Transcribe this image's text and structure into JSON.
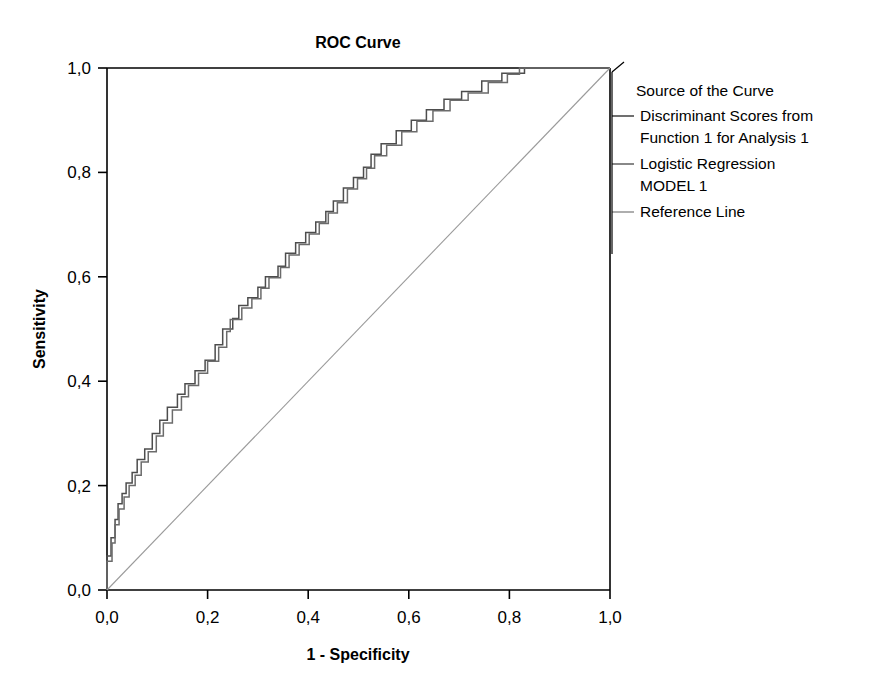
{
  "chart_data": {
    "type": "line",
    "title": "ROC Curve",
    "xlabel": "1 - Specificity",
    "ylabel": "Sensitivity",
    "xlim": [
      0,
      1
    ],
    "ylim": [
      0,
      1
    ],
    "grid": false,
    "legend_position": "right",
    "legend_title": "Source of the Curve",
    "x_ticks": [
      "0,0",
      "0,2",
      "0,4",
      "0,6",
      "0,8",
      "1,0"
    ],
    "y_ticks": [
      "0,0",
      "0,2",
      "0,4",
      "0,6",
      "0,8",
      "1,0"
    ],
    "x_tick_values": [
      0,
      0.2,
      0.4,
      0.6,
      0.8,
      1.0
    ],
    "y_tick_values": [
      0,
      0.2,
      0.4,
      0.6,
      0.8,
      1.0
    ],
    "series": [
      {
        "name": "Discriminant Scores from Function 1 for Analysis 1",
        "color": "#4d4d4d",
        "style": "step",
        "points": [
          [
            0.0,
            0.0
          ],
          [
            0.0,
            0.065
          ],
          [
            0.008,
            0.065
          ],
          [
            0.008,
            0.1
          ],
          [
            0.016,
            0.1
          ],
          [
            0.016,
            0.135
          ],
          [
            0.022,
            0.135
          ],
          [
            0.022,
            0.165
          ],
          [
            0.03,
            0.165
          ],
          [
            0.03,
            0.185
          ],
          [
            0.038,
            0.185
          ],
          [
            0.038,
            0.205
          ],
          [
            0.05,
            0.205
          ],
          [
            0.05,
            0.225
          ],
          [
            0.06,
            0.225
          ],
          [
            0.06,
            0.25
          ],
          [
            0.075,
            0.25
          ],
          [
            0.075,
            0.27
          ],
          [
            0.09,
            0.27
          ],
          [
            0.09,
            0.3
          ],
          [
            0.105,
            0.3
          ],
          [
            0.105,
            0.325
          ],
          [
            0.12,
            0.325
          ],
          [
            0.12,
            0.35
          ],
          [
            0.14,
            0.35
          ],
          [
            0.14,
            0.375
          ],
          [
            0.155,
            0.375
          ],
          [
            0.155,
            0.395
          ],
          [
            0.175,
            0.395
          ],
          [
            0.175,
            0.42
          ],
          [
            0.195,
            0.42
          ],
          [
            0.195,
            0.44
          ],
          [
            0.215,
            0.44
          ],
          [
            0.215,
            0.47
          ],
          [
            0.23,
            0.47
          ],
          [
            0.23,
            0.5
          ],
          [
            0.25,
            0.5
          ],
          [
            0.25,
            0.52
          ],
          [
            0.262,
            0.52
          ],
          [
            0.262,
            0.545
          ],
          [
            0.28,
            0.545
          ],
          [
            0.28,
            0.56
          ],
          [
            0.3,
            0.56
          ],
          [
            0.3,
            0.58
          ],
          [
            0.315,
            0.58
          ],
          [
            0.315,
            0.6
          ],
          [
            0.34,
            0.6
          ],
          [
            0.34,
            0.62
          ],
          [
            0.355,
            0.62
          ],
          [
            0.355,
            0.645
          ],
          [
            0.375,
            0.645
          ],
          [
            0.375,
            0.665
          ],
          [
            0.395,
            0.665
          ],
          [
            0.395,
            0.685
          ],
          [
            0.415,
            0.685
          ],
          [
            0.415,
            0.705
          ],
          [
            0.435,
            0.705
          ],
          [
            0.435,
            0.725
          ],
          [
            0.45,
            0.725
          ],
          [
            0.45,
            0.745
          ],
          [
            0.47,
            0.745
          ],
          [
            0.47,
            0.77
          ],
          [
            0.49,
            0.77
          ],
          [
            0.49,
            0.79
          ],
          [
            0.51,
            0.79
          ],
          [
            0.51,
            0.81
          ],
          [
            0.525,
            0.81
          ],
          [
            0.525,
            0.835
          ],
          [
            0.545,
            0.835
          ],
          [
            0.545,
            0.855
          ],
          [
            0.575,
            0.855
          ],
          [
            0.575,
            0.88
          ],
          [
            0.605,
            0.88
          ],
          [
            0.605,
            0.9
          ],
          [
            0.635,
            0.9
          ],
          [
            0.635,
            0.92
          ],
          [
            0.67,
            0.92
          ],
          [
            0.67,
            0.94
          ],
          [
            0.705,
            0.94
          ],
          [
            0.705,
            0.955
          ],
          [
            0.745,
            0.955
          ],
          [
            0.745,
            0.975
          ],
          [
            0.785,
            0.975
          ],
          [
            0.785,
            0.99
          ],
          [
            0.83,
            0.99
          ],
          [
            0.83,
            1.0
          ],
          [
            1.0,
            1.0
          ]
        ]
      },
      {
        "name": "Logistic Regression MODEL 1",
        "color": "#6b6b6b",
        "style": "step",
        "points": [
          [
            0.0,
            0.0
          ],
          [
            0.0,
            0.055
          ],
          [
            0.01,
            0.055
          ],
          [
            0.01,
            0.09
          ],
          [
            0.016,
            0.09
          ],
          [
            0.016,
            0.125
          ],
          [
            0.024,
            0.125
          ],
          [
            0.024,
            0.155
          ],
          [
            0.034,
            0.155
          ],
          [
            0.034,
            0.178
          ],
          [
            0.044,
            0.178
          ],
          [
            0.044,
            0.2
          ],
          [
            0.056,
            0.2
          ],
          [
            0.056,
            0.22
          ],
          [
            0.068,
            0.22
          ],
          [
            0.068,
            0.245
          ],
          [
            0.082,
            0.245
          ],
          [
            0.082,
            0.265
          ],
          [
            0.098,
            0.265
          ],
          [
            0.098,
            0.295
          ],
          [
            0.112,
            0.295
          ],
          [
            0.112,
            0.32
          ],
          [
            0.13,
            0.32
          ],
          [
            0.13,
            0.345
          ],
          [
            0.148,
            0.345
          ],
          [
            0.148,
            0.37
          ],
          [
            0.162,
            0.37
          ],
          [
            0.162,
            0.392
          ],
          [
            0.182,
            0.392
          ],
          [
            0.182,
            0.415
          ],
          [
            0.2,
            0.415
          ],
          [
            0.2,
            0.438
          ],
          [
            0.222,
            0.438
          ],
          [
            0.222,
            0.465
          ],
          [
            0.238,
            0.465
          ],
          [
            0.238,
            0.495
          ],
          [
            0.245,
            0.495
          ],
          [
            0.245,
            0.518
          ],
          [
            0.268,
            0.518
          ],
          [
            0.268,
            0.54
          ],
          [
            0.288,
            0.54
          ],
          [
            0.288,
            0.558
          ],
          [
            0.306,
            0.558
          ],
          [
            0.306,
            0.578
          ],
          [
            0.322,
            0.578
          ],
          [
            0.322,
            0.598
          ],
          [
            0.345,
            0.598
          ],
          [
            0.345,
            0.618
          ],
          [
            0.362,
            0.618
          ],
          [
            0.362,
            0.642
          ],
          [
            0.382,
            0.642
          ],
          [
            0.382,
            0.662
          ],
          [
            0.402,
            0.662
          ],
          [
            0.402,
            0.682
          ],
          [
            0.422,
            0.682
          ],
          [
            0.422,
            0.702
          ],
          [
            0.44,
            0.702
          ],
          [
            0.44,
            0.722
          ],
          [
            0.458,
            0.722
          ],
          [
            0.458,
            0.742
          ],
          [
            0.478,
            0.742
          ],
          [
            0.478,
            0.768
          ],
          [
            0.498,
            0.768
          ],
          [
            0.498,
            0.788
          ],
          [
            0.516,
            0.788
          ],
          [
            0.516,
            0.808
          ],
          [
            0.532,
            0.808
          ],
          [
            0.532,
            0.832
          ],
          [
            0.556,
            0.832
          ],
          [
            0.556,
            0.852
          ],
          [
            0.586,
            0.852
          ],
          [
            0.586,
            0.878
          ],
          [
            0.616,
            0.878
          ],
          [
            0.616,
            0.898
          ],
          [
            0.648,
            0.898
          ],
          [
            0.648,
            0.918
          ],
          [
            0.682,
            0.918
          ],
          [
            0.682,
            0.938
          ],
          [
            0.718,
            0.938
          ],
          [
            0.718,
            0.952
          ],
          [
            0.758,
            0.952
          ],
          [
            0.758,
            0.972
          ],
          [
            0.796,
            0.972
          ],
          [
            0.796,
            0.988
          ],
          [
            0.82,
            0.988
          ],
          [
            0.82,
            1.0
          ],
          [
            1.0,
            1.0
          ]
        ]
      },
      {
        "name": "Reference Line",
        "color": "#9a9a9a",
        "style": "line",
        "points": [
          [
            0.0,
            0.0
          ],
          [
            1.0,
            1.0
          ]
        ]
      }
    ]
  },
  "legend": {
    "title": "Source of the Curve",
    "entries": [
      {
        "lines": [
          "Discriminant Scores from",
          "Function 1 for Analysis 1"
        ],
        "color": "#4d4d4d"
      },
      {
        "lines": [
          "Logistic Regression",
          "MODEL 1"
        ],
        "color": "#6b6b6b"
      },
      {
        "lines": [
          "Reference Line"
        ],
        "color": "#9a9a9a"
      }
    ]
  }
}
